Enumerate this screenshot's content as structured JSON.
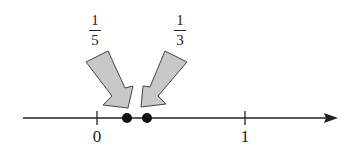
{
  "diagram": {
    "type": "number-line",
    "ticks": [
      {
        "label": "0",
        "value": 0
      },
      {
        "label": "1",
        "value": 1
      }
    ],
    "points": [
      {
        "value": 0.2,
        "label": {
          "numerator": "1",
          "denominator": "5"
        }
      },
      {
        "value": 0.3333,
        "label": {
          "numerator": "1",
          "denominator": "3"
        }
      }
    ],
    "colors": {
      "arrow_fill": "#c8c8c8",
      "line": "#222222"
    }
  }
}
